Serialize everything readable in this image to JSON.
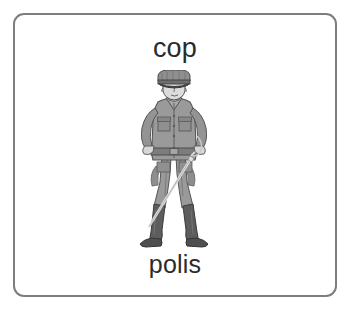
{
  "card": {
    "term_english": "cop",
    "term_swedish": "polis",
    "border_color": "#7e7e7e",
    "background_color": "#ffffff",
    "text_color": "#2b2b2b"
  },
  "illustration": {
    "name": "policeman-illustration",
    "description": "Grayscale drawing of a policeman in uniform standing with hands on hips",
    "colors": {
      "uniform_mid": "#9a9a9a",
      "uniform_shadow": "#7b7b7b",
      "uniform_light": "#b4b4b4",
      "skin": "#dcdcdc",
      "boots": "#585858",
      "outline": "#4a4a4a",
      "baton": "#e6e6e6"
    }
  }
}
